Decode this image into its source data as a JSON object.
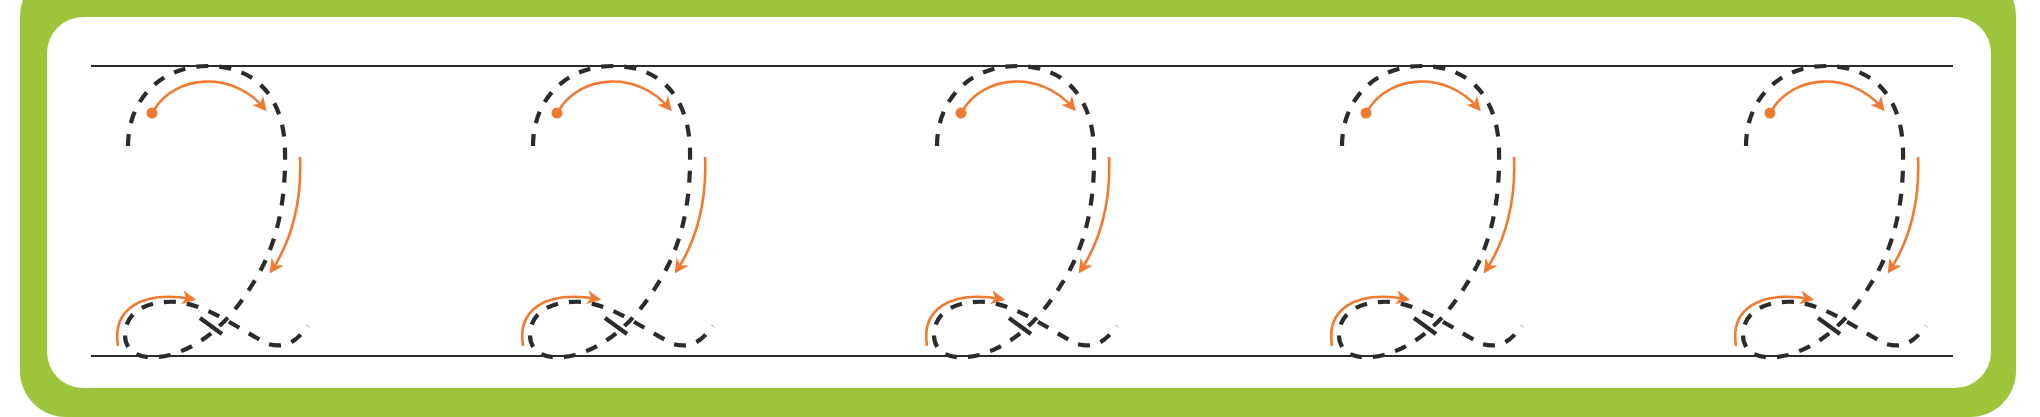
{
  "worksheet": {
    "title": "Number 2 tracing practice",
    "character": "2",
    "repetitions": 5,
    "colors": {
      "frame": "#9dc43a",
      "panel": "#ffffff",
      "guide_line": "#2b2b2b",
      "trace_dash": "#2b2b2b",
      "direction_arrow": "#f07a32"
    },
    "guide_lines": {
      "top_y": 66,
      "bottom_y": 356,
      "x_start": 91,
      "x_end": 1953
    },
    "glyph_offsets_x": [
      0,
      405,
      809,
      1214,
      1618
    ],
    "glyphs": [
      {
        "label": "tracing-2-1"
      },
      {
        "label": "tracing-2-2"
      },
      {
        "label": "tracing-2-3"
      },
      {
        "label": "tracing-2-4"
      },
      {
        "label": "tracing-2-5"
      }
    ]
  }
}
